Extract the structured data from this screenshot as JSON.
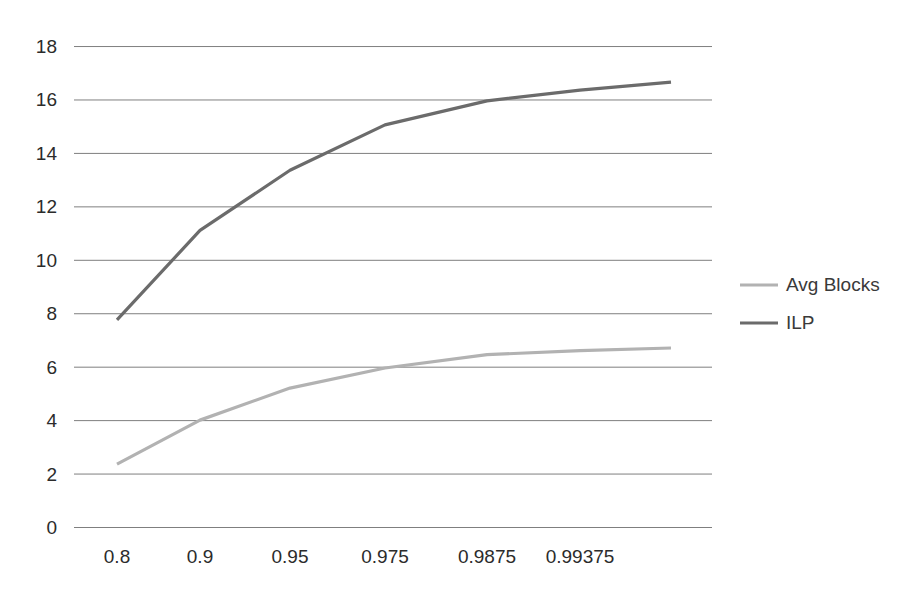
{
  "chart_data": {
    "type": "line",
    "title": "",
    "subtitle": "",
    "xlabel": "",
    "ylabel": "",
    "x": [
      "0.8",
      "0.9",
      "0.95",
      "0.975",
      "0.9875",
      "0.99375",
      ""
    ],
    "categories": [
      "0.8",
      "0.9",
      "0.95",
      "0.975",
      "0.9875",
      "0.99375",
      ""
    ],
    "xtick_labels": [
      "0.8",
      "0.9",
      "0.95",
      "0.975",
      "0.9875",
      "0.99375"
    ],
    "ytick_labels": [
      "18",
      "16",
      "14",
      "12",
      "10",
      "8",
      "6",
      "4",
      "2",
      "0"
    ],
    "ylim": [
      0,
      18
    ],
    "ytick_step": 2,
    "grid": true,
    "grid_axis": "y",
    "legend_position": "right",
    "series": [
      {
        "name": "Avg Blocks",
        "color": "#b2b2b2",
        "values": [
          2.35,
          4.0,
          5.2,
          5.95,
          6.45,
          6.6,
          6.7
        ]
      },
      {
        "name": "ILP",
        "color": "#6b6b6b",
        "values": [
          7.75,
          11.1,
          13.35,
          15.05,
          15.95,
          16.35,
          16.65
        ]
      }
    ]
  },
  "legend": {
    "entries": [
      {
        "label": "Avg Blocks",
        "color": "#b2b2b2"
      },
      {
        "label": "ILP",
        "color": "#6b6b6b"
      }
    ]
  },
  "style": {
    "background": "#ffffff",
    "grid_color": "#7f7f7f",
    "tick_text_color": "#2b2b2b",
    "legend_text_color": "#3a3a3a"
  },
  "geometry": {
    "plot_left": 74,
    "plot_right": 712,
    "plot_top": 46,
    "plot_bottom": 527,
    "point_x": [
      117,
      200,
      290,
      385,
      487,
      580,
      671
    ],
    "value_to_y_zero": 527,
    "value_to_y_scale": 26.72
  }
}
